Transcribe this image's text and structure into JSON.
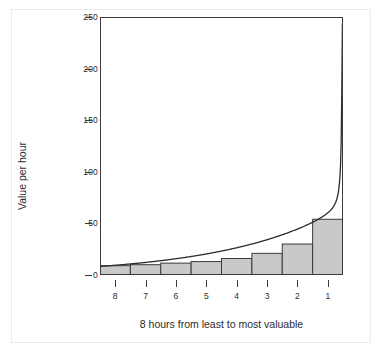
{
  "chart_data": {
    "type": "bar",
    "title": "",
    "subtitle": "",
    "xlabel": "8 hours from least to most valuable",
    "ylabel": "Value per hour",
    "categories": [
      "8",
      "7",
      "6",
      "5",
      "4",
      "3",
      "2",
      "1"
    ],
    "values": [
      9,
      10,
      11.5,
      13,
      16,
      21,
      30,
      54
    ],
    "xlim": [
      0,
      8
    ],
    "ylim": [
      0,
      250
    ],
    "yticks": [
      0,
      50,
      100,
      150,
      200,
      250
    ],
    "ytick_labels": [
      "0",
      "50",
      "100",
      "150",
      "200",
      "250"
    ],
    "xtick_labels": [
      "8",
      "7",
      "6",
      "5",
      "4",
      "3",
      "2",
      "1"
    ],
    "grid": false,
    "legend": null,
    "series": [
      {
        "name": "hourly value bars",
        "type": "bar",
        "values": [
          9,
          10,
          11.5,
          13,
          16,
          21,
          30,
          54
        ]
      },
      {
        "name": "marginal value curve",
        "type": "line",
        "note": "smooth convex curve rising asymptotically toward the right edge, passing near the top of each bar and reaching 250 at the right boundary"
      }
    ],
    "bar_fill_color": "#c9c9c9",
    "bar_edge_color": "#3a3a3a",
    "curve_color": "#2b2b2b",
    "axis_color": "#3a3a3a",
    "background_color": "#ffffff"
  },
  "axes": {
    "y_title": "Value per hour",
    "x_title": "8 hours from least to most valuable"
  }
}
